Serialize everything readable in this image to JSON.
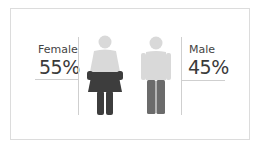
{
  "infographic": {
    "female": {
      "label": "Female",
      "percent_text": "55%",
      "percent_value": 55,
      "icon": "female-figure-icon"
    },
    "male": {
      "label": "Male",
      "percent_text": "45%",
      "percent_value": 45,
      "icon": "male-figure-icon"
    }
  },
  "colors": {
    "figure_light": "#d9d9d9",
    "female_fill": "#3d3d3d",
    "male_fill": "#6b6b6b",
    "lines": "#cfcfcf",
    "frame": "#dcdcdc"
  }
}
